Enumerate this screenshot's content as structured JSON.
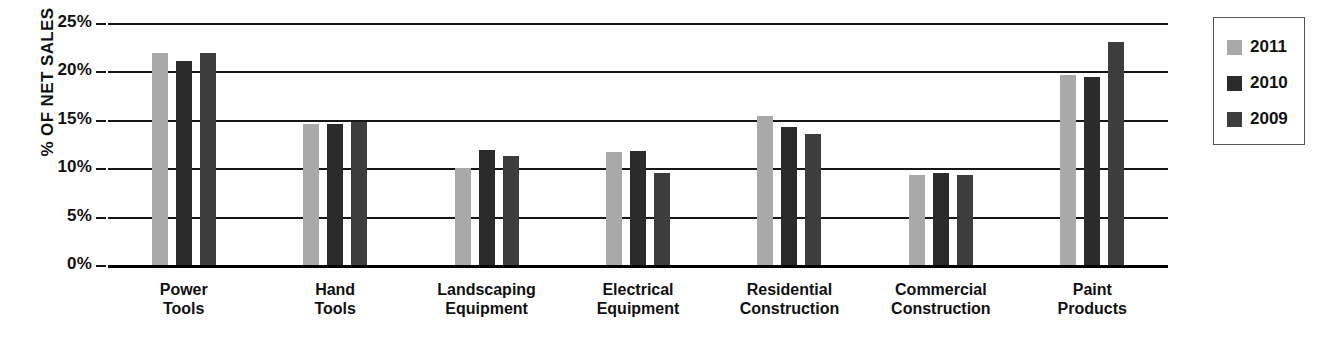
{
  "chart_data": {
    "type": "bar",
    "title": "",
    "xlabel": "",
    "ylabel": "% OF NET SALES",
    "ylim": [
      0,
      25
    ],
    "ytick_labels": [
      "25%",
      "20%",
      "15%",
      "10%",
      "5%",
      "0%"
    ],
    "ytick_values": [
      25,
      20,
      15,
      10,
      5,
      0
    ],
    "grid": true,
    "legend_position": "right",
    "categories": [
      "Power\nTools",
      "Hand\nTools",
      "Landscaping\nEquipment",
      "Electrical\nEquipment",
      "Residential\nConstruction",
      "Commercial\nConstruction",
      "Paint\nProducts"
    ],
    "category_lines": [
      [
        "Power",
        "Tools"
      ],
      [
        "Hand",
        "Tools"
      ],
      [
        "Landscaping",
        "Equipment"
      ],
      [
        "Electrical",
        "Equipment"
      ],
      [
        "Residential",
        "Construction"
      ],
      [
        "Commercial",
        "Construction"
      ],
      [
        "Paint",
        "Products"
      ]
    ],
    "series": [
      {
        "name": "2011",
        "color": "#a9a9a9",
        "values": [
          21.9,
          14.6,
          10.0,
          11.7,
          15.4,
          9.3,
          19.6
        ]
      },
      {
        "name": "2010",
        "color": "#2b2b2b",
        "values": [
          21.1,
          14.6,
          11.9,
          11.8,
          14.3,
          9.5,
          19.4
        ]
      },
      {
        "name": "2009",
        "color": "#3d3d3d",
        "values": [
          21.9,
          14.8,
          11.3,
          9.5,
          13.5,
          9.3,
          23.0
        ]
      }
    ]
  },
  "legend": {
    "items": [
      {
        "label": "2011",
        "swatch": "#a9a9a9"
      },
      {
        "label": "2010",
        "swatch": "#2b2b2b"
      },
      {
        "label": "2009",
        "swatch": "#3d3d3d"
      }
    ]
  },
  "axis": {
    "y_title": "% OF NET SALES",
    "ticks": [
      "25%",
      "20%",
      "15%",
      "10%",
      "5%",
      "0%"
    ]
  }
}
